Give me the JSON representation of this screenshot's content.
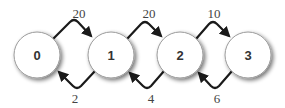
{
  "diagram": {
    "type": "state-transition",
    "colors": {
      "node_fill": "#ffffff",
      "node_stroke": "#9a9a9a",
      "edge": "#1a1a1a",
      "text": "#333333"
    },
    "nodes": [
      {
        "id": "0",
        "label": "0"
      },
      {
        "id": "1",
        "label": "1"
      },
      {
        "id": "2",
        "label": "2"
      },
      {
        "id": "3",
        "label": "3"
      }
    ],
    "forward_edges": [
      {
        "from": "0",
        "to": "1",
        "label": "20"
      },
      {
        "from": "1",
        "to": "2",
        "label": "20"
      },
      {
        "from": "2",
        "to": "3",
        "label": "10"
      }
    ],
    "backward_edges": [
      {
        "from": "1",
        "to": "0",
        "label": "2"
      },
      {
        "from": "2",
        "to": "1",
        "label": "4"
      },
      {
        "from": "3",
        "to": "2",
        "label": "6"
      }
    ]
  }
}
